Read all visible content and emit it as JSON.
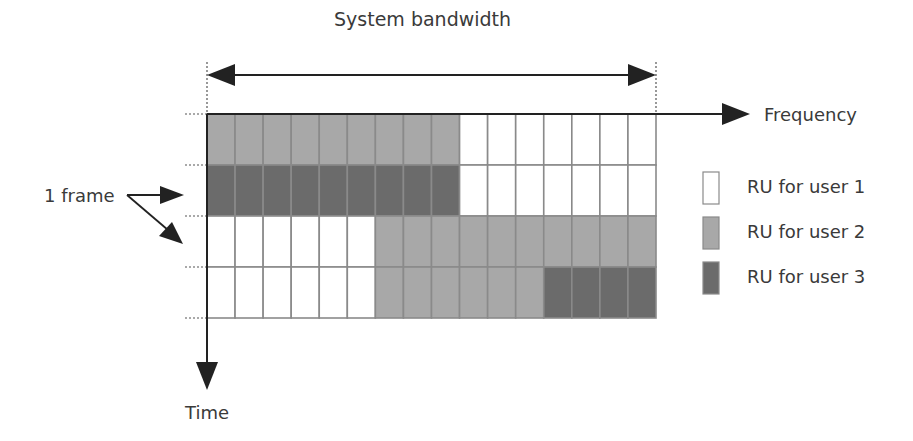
{
  "title": "System bandwidth",
  "axes": {
    "x_label": "Frequency",
    "y_label": "Time"
  },
  "annotation": {
    "frame_label": "1 frame"
  },
  "legend": [
    {
      "label": "RU for user 1",
      "color": "#ffffff"
    },
    {
      "label": "RU for user 2",
      "color": "#a8a8a8"
    },
    {
      "label": "RU for user 3",
      "color": "#6b6b6b"
    }
  ],
  "colors": {
    "user1": "#ffffff",
    "user2": "#a8a8a8",
    "user3": "#6b6b6b",
    "grid_line": "#8a8a8a",
    "axis": "#333333"
  },
  "grid": {
    "columns": 16,
    "rows": [
      {
        "segments": [
          {
            "user": 2,
            "count": 9
          },
          {
            "user": 1,
            "count": 7
          }
        ]
      },
      {
        "segments": [
          {
            "user": 3,
            "count": 9
          },
          {
            "user": 1,
            "count": 7
          }
        ]
      },
      {
        "segments": [
          {
            "user": 1,
            "count": 6
          },
          {
            "user": 2,
            "count": 10
          }
        ]
      },
      {
        "segments": [
          {
            "user": 1,
            "count": 6
          },
          {
            "user": 2,
            "count": 6
          },
          {
            "user": 3,
            "count": 4
          }
        ]
      }
    ]
  }
}
